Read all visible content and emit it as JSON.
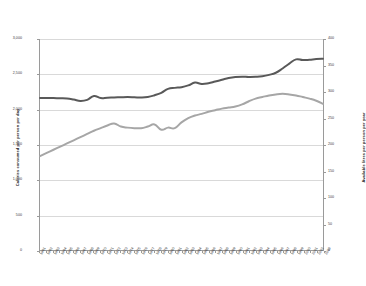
{
  "chart_data": {
    "type": "line",
    "title": "",
    "subtitle": "",
    "xlabel": "",
    "ylabel": "Calories consumed per person per day",
    "y2label": "Available litres per person per year",
    "ylim": [
      0,
      3000
    ],
    "y2lim": [
      0,
      400
    ],
    "grid": true,
    "legend": "none",
    "y_ticks": [
      "0",
      "500",
      "1,000",
      "1,500",
      "2,000",
      "2,500",
      "3,000"
    ],
    "y_tick_values": [
      0,
      500,
      1000,
      1500,
      2000,
      2500,
      3000
    ],
    "y2_ticks": [
      "0",
      "50",
      "100",
      "150",
      "200",
      "250",
      "300",
      "350",
      "400"
    ],
    "y2_tick_values": [
      0,
      50,
      100,
      150,
      200,
      250,
      300,
      350,
      400
    ],
    "categories": [
      "1961",
      "1962",
      "1963",
      "1964",
      "1965",
      "1966",
      "1967",
      "1968",
      "1969",
      "1970",
      "1971",
      "1972",
      "1973",
      "1974",
      "1975",
      "1976",
      "1977",
      "1978",
      "1979",
      "1980",
      "1981",
      "1982",
      "1983",
      "1984",
      "1985",
      "1986",
      "1987",
      "1988",
      "1989",
      "1990",
      "1991",
      "1992",
      "1993",
      "1994",
      "1995",
      "1996",
      "1997",
      "1998",
      "1999",
      "2000",
      "2001",
      "2002",
      "2003"
    ],
    "series": [
      {
        "name": "Calories consumed per person per day",
        "axis": "left",
        "color": "#595959",
        "values": [
          2160,
          2162,
          2160,
          2158,
          2155,
          2140,
          2120,
          2135,
          2190,
          2160,
          2165,
          2168,
          2172,
          2175,
          2172,
          2168,
          2175,
          2200,
          2235,
          2290,
          2305,
          2315,
          2340,
          2380,
          2360,
          2370,
          2395,
          2420,
          2445,
          2460,
          2465,
          2460,
          2462,
          2470,
          2490,
          2520,
          2580,
          2650,
          2710,
          2700,
          2705,
          2715,
          2718
        ]
      },
      {
        "name": "Available litres per person per year",
        "axis": "right",
        "color": "#a6a6a6",
        "values": [
          178,
          184,
          190,
          196,
          202,
          208,
          214,
          220,
          226,
          231,
          236,
          240,
          234,
          232,
          231,
          231,
          234,
          238,
          228,
          232,
          231,
          242,
          250,
          255,
          258,
          262,
          265,
          268,
          270,
          272,
          276,
          282,
          287,
          290,
          293,
          295,
          296,
          295,
          293,
          290,
          287,
          283,
          277
        ]
      }
    ]
  }
}
